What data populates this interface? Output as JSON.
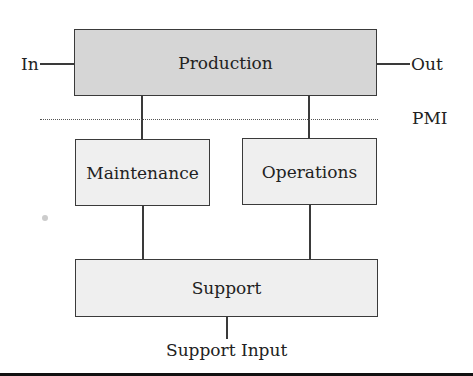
{
  "diagram": {
    "nodes": {
      "production": "Production",
      "maintenance": "Maintenance",
      "operations": "Operations",
      "support": "Support"
    },
    "labels": {
      "input": "In",
      "output": "Out",
      "pmi": "PMI",
      "support_input": "Support Input"
    },
    "colors": {
      "production_fill": "#d6d6d6",
      "subsystem_fill": "#efefef",
      "stroke": "#3a3a3a"
    }
  }
}
